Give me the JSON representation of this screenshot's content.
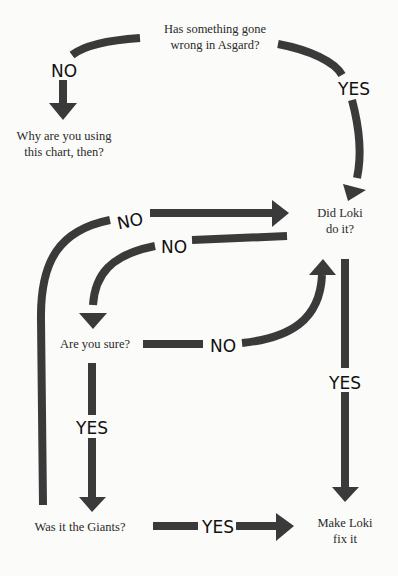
{
  "colors": {
    "background": "#fbfbf9",
    "arrow": "#3a3a3a",
    "text": "#2a2a2a",
    "label": "#111111"
  },
  "nodes": {
    "start": {
      "line1": "Has something gone",
      "line2": "wrong in Asgard?"
    },
    "why": {
      "line1": "Why are you using",
      "line2": "this chart, then?"
    },
    "loki": {
      "line1": "Did Loki",
      "line2": "do it?"
    },
    "sure": {
      "line1": "Are you sure?"
    },
    "giants": {
      "line1": "Was it the Giants?"
    },
    "fix": {
      "line1": "Make Loki",
      "line2": "fix it"
    }
  },
  "edges": [
    {
      "from": "start",
      "to": "why",
      "label": "NO"
    },
    {
      "from": "start",
      "to": "loki",
      "label": "YES"
    },
    {
      "from": "giants",
      "to": "loki",
      "label": "NO"
    },
    {
      "from": "loki",
      "to": "sure",
      "label": "NO"
    },
    {
      "from": "sure",
      "to": "loki",
      "label": "NO"
    },
    {
      "from": "sure",
      "to": "giants",
      "label": "YES"
    },
    {
      "from": "loki",
      "to": "fix",
      "label": "YES"
    },
    {
      "from": "giants",
      "to": "fix",
      "label": "YES"
    }
  ]
}
